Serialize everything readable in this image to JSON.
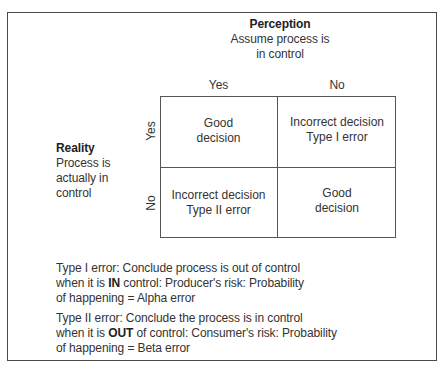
{
  "perception": {
    "title": "Perception",
    "line1": "Assume process is",
    "line2": "in control"
  },
  "columns": [
    "Yes",
    "No"
  ],
  "reality": {
    "title": "Reality",
    "line1": "Process is",
    "line2": "actually in",
    "line3": "control"
  },
  "rows": [
    "Yes",
    "No"
  ],
  "cells": [
    {
      "line1": "Good",
      "line2": "decision"
    },
    {
      "line1": "Incorrect decision",
      "line2": "Type I error"
    },
    {
      "line1": "Incorrect decision",
      "line2": "Type II error"
    },
    {
      "line1": "Good",
      "line2": "decision"
    }
  ],
  "notes": {
    "type1": {
      "line1": "Type I error: Conclude process is out of control",
      "line2_pre": "when it is ",
      "line2_bold": "IN",
      "line2_post": " control: Producer's risk: Probability",
      "line3": "of happening = Alpha error"
    },
    "type2": {
      "line1": "Type II error: Conclude the process is in control",
      "line2_pre": "when it is ",
      "line2_bold": "OUT",
      "line2_post": " of control: Consumer's risk: Probability",
      "line3": "of happening = Beta error"
    }
  }
}
